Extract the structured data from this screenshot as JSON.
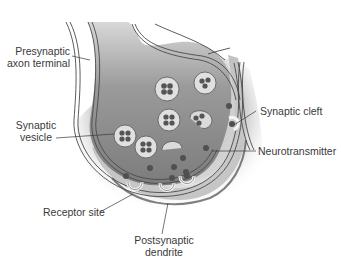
{
  "diagram": {
    "colors": {
      "cytoplasm_dark": "#7f7f7f",
      "cytoplasm_light": "#bdbdbd",
      "membrane": "#4a4a4a",
      "vesicle_fill": "#dcdcdc",
      "neurotransmitter": "#505050",
      "receptor": "#f2f2f2",
      "text": "#3a3a3a"
    },
    "labels": {
      "presynaptic_line1": "Presynaptic",
      "presynaptic_line2": "axon terminal",
      "vesicle_line1": "Synaptic",
      "vesicle_line2": "vesicle",
      "cleft": "Synaptic cleft",
      "neurotransmitter": "Neurotransmitter",
      "receptor": "Receptor site",
      "postsynaptic_line1": "Postsynaptic",
      "postsynaptic_line2": "dendrite"
    }
  }
}
